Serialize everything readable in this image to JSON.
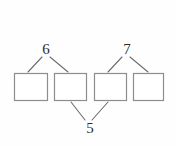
{
  "diagram": {
    "type": "number-bond-tree",
    "background_color": "#fefefe",
    "line_color": "#6d6d6d",
    "box_stroke_color": "#8d8d8d",
    "box_fill_color": "#ffffff",
    "label_color": "#2b2b2b",
    "boxes": [
      {
        "id": "box-1",
        "label": "",
        "x": 14,
        "y": 73,
        "width": 34,
        "height": 28
      },
      {
        "id": "box-2",
        "label": "",
        "x": 54,
        "y": 73,
        "width": 33,
        "height": 28
      },
      {
        "id": "box-3",
        "label": "",
        "x": 94,
        "y": 73,
        "width": 33,
        "height": 28
      },
      {
        "id": "box-4",
        "label": "",
        "x": 133,
        "y": 73,
        "width": 31,
        "height": 28
      }
    ],
    "labels": [
      {
        "id": "label-6",
        "value": "6",
        "x": 45,
        "y": 42,
        "position": "top-left"
      },
      {
        "id": "label-7",
        "value": "7",
        "x": 126,
        "y": 42,
        "position": "top-right"
      },
      {
        "id": "label-5",
        "value": "5",
        "x": 88,
        "y": 122,
        "position": "bottom-center"
      }
    ],
    "edges": [
      {
        "id": "edge-6-box1",
        "from": "label-6",
        "to": "box-1",
        "x1": 42,
        "y1": 57,
        "x2": 28,
        "y2": 72
      },
      {
        "id": "edge-6-box2",
        "from": "label-6",
        "to": "box-2",
        "x1": 50,
        "y1": 57,
        "x2": 68,
        "y2": 72
      },
      {
        "id": "edge-7-box3",
        "from": "label-7",
        "to": "box-3",
        "x1": 122,
        "y1": 57,
        "x2": 108,
        "y2": 72
      },
      {
        "id": "edge-7-box4",
        "from": "label-7",
        "to": "box-4",
        "x1": 130,
        "y1": 57,
        "x2": 148,
        "y2": 72
      },
      {
        "id": "edge-5-box2",
        "from": "label-5",
        "to": "box-2",
        "x1": 85,
        "y1": 120,
        "x2": 71,
        "y2": 102
      },
      {
        "id": "edge-5-box3",
        "from": "label-5",
        "to": "box-3",
        "x1": 92,
        "y1": 120,
        "x2": 108,
        "y2": 102
      }
    ]
  }
}
